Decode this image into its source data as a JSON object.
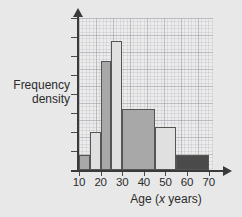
{
  "chart_data": {
    "type": "bar",
    "title": "",
    "subtitle": "",
    "xlabel_prefix": "Age (",
    "xlabel_variable": "x",
    "xlabel_suffix": " years)",
    "xlabel_full": "Age (x years)",
    "ylabel_line1": "Frequency",
    "ylabel_line2": "density",
    "ylabel_full": "Frequency density",
    "grid": true,
    "legend": "none",
    "xlim": [
      10,
      72
    ],
    "ylim": [
      0,
      1.0
    ],
    "xticks": [
      10,
      20,
      30,
      40,
      50,
      60,
      70
    ],
    "xtick_labels": [
      "10",
      "20",
      "30",
      "40",
      "50",
      "60",
      "70"
    ],
    "ytick_labels": [],
    "ytick_count": 8,
    "bins": [
      {
        "label": "10-15",
        "x_start": 10,
        "x_end": 15,
        "frequency_density": 0.1,
        "fill": "#a8a8a8"
      },
      {
        "label": "15-20",
        "x_start": 15,
        "x_end": 20,
        "frequency_density": 0.25,
        "fill": "#e0e0e0"
      },
      {
        "label": "20-25",
        "x_start": 20,
        "x_end": 25,
        "frequency_density": 0.72,
        "fill": "#a8a8a8"
      },
      {
        "label": "25-30",
        "x_start": 25,
        "x_end": 30,
        "frequency_density": 0.85,
        "fill": "#e0e0e0"
      },
      {
        "label": "30-45",
        "x_start": 30,
        "x_end": 45,
        "frequency_density": 0.4,
        "fill": "#a8a8a8"
      },
      {
        "label": "45-55",
        "x_start": 45,
        "x_end": 55,
        "frequency_density": 0.28,
        "fill": "#e0e0e0"
      },
      {
        "label": "55-70",
        "x_start": 55,
        "x_end": 70,
        "frequency_density": 0.1,
        "fill": "#4a4a4a"
      }
    ]
  },
  "style": {
    "page_background": "#e8e8e8",
    "plot_background": "#ececec",
    "axis_color": "#3a3a3a",
    "text_color": "#2b2b2b",
    "grid_color": "#8c8c9b"
  }
}
